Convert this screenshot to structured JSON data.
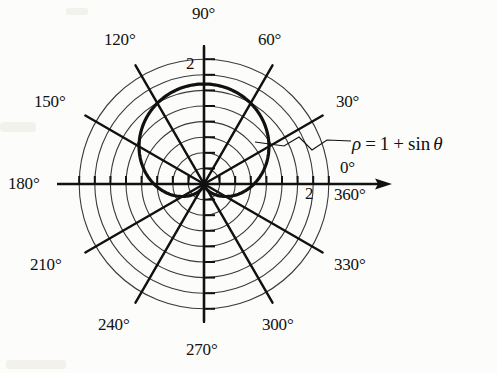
{
  "figure": {
    "kind": "polar-plot",
    "equation_plain": "rho = 1 + sin theta",
    "equation_parts": {
      "rho": "ρ",
      "equals": "=",
      "one": "1",
      "plus": "+",
      "sin": "sin",
      "theta": "θ"
    },
    "background_color": "#fcfcfa",
    "curve_color": "#111111",
    "grid_color": "#3a3a3a",
    "axis_color": "#111111"
  },
  "angle_labels": [
    {
      "text": "90°",
      "deg": 90,
      "x": 192,
      "y": 4
    },
    {
      "text": "120°",
      "deg": 120,
      "x": 104,
      "y": 30
    },
    {
      "text": "60°",
      "deg": 60,
      "x": 258,
      "y": 30
    },
    {
      "text": "150°",
      "deg": 150,
      "x": 34,
      "y": 92
    },
    {
      "text": "30°",
      "deg": 30,
      "x": 336,
      "y": 92
    },
    {
      "text": "180°",
      "deg": 180,
      "x": 8,
      "y": 174
    },
    {
      "text": "0°",
      "deg": 0,
      "x": 340,
      "y": 158
    },
    {
      "text": "360°",
      "deg": 360,
      "x": 334,
      "y": 185
    },
    {
      "text": "210°",
      "deg": 210,
      "x": 30,
      "y": 255
    },
    {
      "text": "330°",
      "deg": 330,
      "x": 334,
      "y": 255
    },
    {
      "text": "240°",
      "deg": 240,
      "x": 98,
      "y": 315
    },
    {
      "text": "300°",
      "deg": 300,
      "x": 262,
      "y": 315
    },
    {
      "text": "270°",
      "deg": 270,
      "x": 186,
      "y": 340
    }
  ],
  "radial_labels": [
    {
      "text": "2",
      "value": 2,
      "axis": "90",
      "x": 186,
      "y": 54
    },
    {
      "text": "2",
      "value": 2,
      "axis": "0",
      "x": 305,
      "y": 184
    }
  ],
  "chart_data": {
    "type": "line",
    "coordinate_system": "polar",
    "title": "",
    "equation": "ρ = 1 + sin θ",
    "curve_name": "cardioid",
    "theta_unit": "degrees",
    "theta_range": [
      0,
      360
    ],
    "rho_range": [
      0,
      2
    ],
    "radial_ticks": [
      0.25,
      0.5,
      0.75,
      1,
      1.25,
      1.5,
      1.75,
      2
    ],
    "radial_labeled_ticks": [
      2
    ],
    "angular_ticks": [
      0,
      30,
      60,
      90,
      120,
      150,
      180,
      210,
      240,
      270,
      300,
      330,
      360
    ],
    "grid": true,
    "legend": "none",
    "annotations": [
      "ρ = 1 + sin θ"
    ],
    "series": [
      {
        "name": "ρ = 1 + sin θ",
        "theta": [
          0,
          15,
          30,
          45,
          60,
          75,
          90,
          105,
          120,
          135,
          150,
          165,
          180,
          195,
          210,
          225,
          240,
          255,
          270,
          285,
          300,
          315,
          330,
          345,
          360
        ],
        "rho": [
          1.0,
          1.259,
          1.5,
          1.707,
          1.866,
          1.966,
          2.0,
          1.966,
          1.866,
          1.707,
          1.5,
          1.259,
          1.0,
          0.741,
          0.5,
          0.293,
          0.134,
          0.034,
          0.0,
          0.034,
          0.134,
          0.293,
          0.5,
          0.741,
          1.0
        ]
      }
    ]
  },
  "geometry": {
    "center_x": 204,
    "center_y": 184,
    "unit_px": 50,
    "grid_circle_count": 8,
    "grid_circle_step_px": 15.6,
    "outer_radius_px": 125,
    "spoke_step_deg": 30,
    "axis_arrow_end_x": 392
  }
}
